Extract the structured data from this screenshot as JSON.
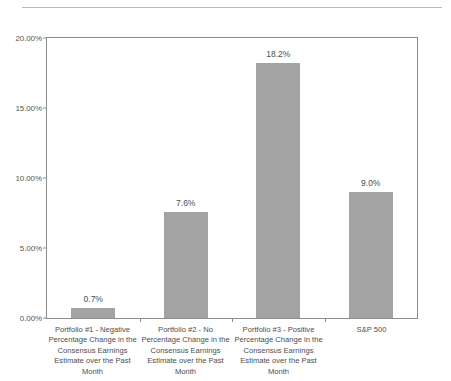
{
  "chart_data": {
    "type": "bar",
    "title": "",
    "subtitle": "",
    "xlabel": "",
    "ylabel": "",
    "ylim": [
      0,
      20
    ],
    "y_ticks": [
      "0.00%",
      "5.00%",
      "10.00%",
      "15.00%",
      "20.00%"
    ],
    "y_tick_values": [
      0,
      5,
      10,
      15,
      20
    ],
    "grid": false,
    "legend": false,
    "bar_color": "#a3a3a3",
    "categories": [
      "Portfolio #1 - Negative Percentage Change in the Consensus Earnings Estimate over the Past Month",
      "Portfolio #2 - No Percentage Change in the Consensus Earnings Estimate over the Past Month",
      "Portfolio #3 - Positive Percentage Change in the Consensus Earnings Estimate over the Past Month",
      "S&P 500"
    ],
    "values": [
      0.7,
      7.6,
      18.2,
      9.0
    ],
    "value_labels": [
      "0.7%",
      "7.6%",
      "18.2%",
      "9.0%"
    ]
  },
  "axis": {
    "y": {
      "t0": "0.00%",
      "t1": "5.00%",
      "t2": "10.00%",
      "t3": "15.00%",
      "t4": "20.00%"
    }
  },
  "bars": {
    "b0": {
      "label": "0.7%"
    },
    "b1": {
      "label": "7.6%"
    },
    "b2": {
      "label": "18.2%"
    },
    "b3": {
      "label": "9.0%"
    }
  },
  "categories": {
    "c0": "Portfolio #1 - Negative Percentage Change in the Consensus Earnings Estimate over the Past Month",
    "c1": "Portfolio #2 - No Percentage Change in the Consensus Earnings Estimate over the Past Month",
    "c2": "Portfolio #3 - Positive Percentage Change in the Consensus Earnings Estimate over the Past Month",
    "c3": "S&P 500"
  }
}
